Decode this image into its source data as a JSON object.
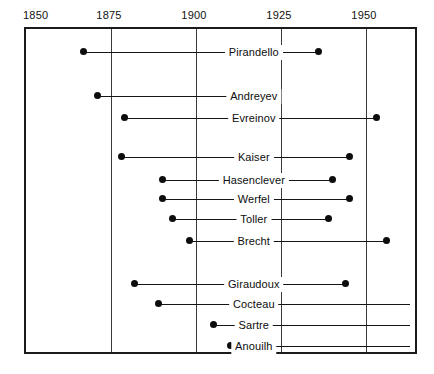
{
  "chart_data": {
    "type": "table",
    "title": "",
    "subtitle": "",
    "xlabel": "",
    "ylabel": "",
    "xlim": [
      1850,
      1963
    ],
    "grid": true,
    "legend": "none",
    "tick_labels": [
      "1850",
      "1875",
      "1900",
      "1925",
      "1950"
    ],
    "tick_values": [
      1850,
      1875,
      1900,
      1925,
      1950
    ],
    "categories": [
      "Pirandello",
      "Andreyev",
      "Evreinov",
      "Kaiser",
      "Hasenclever",
      "Werfel",
      "Toller",
      "Brecht",
      "Giraudoux",
      "Cocteau",
      "Sartre",
      "Anouilh"
    ],
    "series": [
      {
        "name": "lifespan",
        "spans": [
          {
            "label": "Pirandello",
            "start": 1867,
            "end": 1936,
            "start_open": false,
            "end_open": false
          },
          {
            "label": "Andreyev",
            "start": 1871,
            "end": 1919,
            "start_open": false,
            "end_open": false
          },
          {
            "label": "Evreinov",
            "start": 1879,
            "end": 1953,
            "start_open": false,
            "end_open": false
          },
          {
            "label": "Kaiser",
            "start": 1878,
            "end": 1945,
            "start_open": false,
            "end_open": false
          },
          {
            "label": "Hasenclever",
            "start": 1890,
            "end": 1940,
            "start_open": false,
            "end_open": false
          },
          {
            "label": "Werfel",
            "start": 1890,
            "end": 1945,
            "start_open": false,
            "end_open": false
          },
          {
            "label": "Toller",
            "start": 1893,
            "end": 1939,
            "start_open": false,
            "end_open": false
          },
          {
            "label": "Brecht",
            "start": 1898,
            "end": 1956,
            "start_open": false,
            "end_open": false
          },
          {
            "label": "Giraudoux",
            "start": 1882,
            "end": 1944,
            "start_open": false,
            "end_open": false
          },
          {
            "label": "Cocteau",
            "start": 1889,
            "end": 1963,
            "start_open": false,
            "end_open": true
          },
          {
            "label": "Sartre",
            "start": 1905,
            "end": 1963,
            "start_open": false,
            "end_open": true
          },
          {
            "label": "Anouilh",
            "start": 1910,
            "end": 1963,
            "start_open": false,
            "end_open": true
          }
        ]
      }
    ]
  },
  "layout": {
    "plot_left_px": 24,
    "plot_top_px": 27,
    "plot_width_px": 393,
    "plot_height_px": 327,
    "px_per_year": 3.4,
    "row_y_px": [
      44,
      88,
      110,
      149,
      172,
      191,
      211,
      233,
      276,
      296,
      317,
      338
    ]
  },
  "colors": {
    "background": "#ffffff",
    "frame": "#1b1b1b",
    "gridline": "#3a3a3a",
    "line": "#141414",
    "dot": "#0d0d0d",
    "text": "#111111"
  }
}
